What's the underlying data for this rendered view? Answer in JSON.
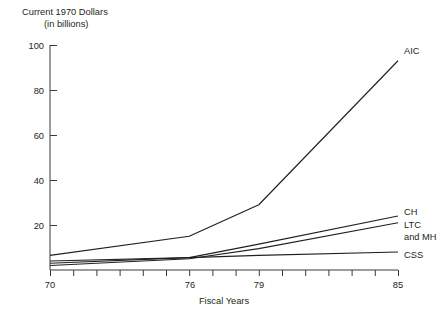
{
  "chart_data": {
    "type": "line",
    "title": "Current 1970 Dollars",
    "subtitle": "(in billions)",
    "xlabel": "Fiscal Years",
    "ylabel": "",
    "xlim": [
      70,
      85
    ],
    "ylim": [
      0,
      100
    ],
    "grid": false,
    "legend_position": "right-of-line-ends",
    "y_ticks": [
      20,
      40,
      60,
      80,
      100
    ],
    "y_tick_labels": [
      "20",
      "40",
      "60",
      "80",
      "100"
    ],
    "x_ticks": [
      70,
      71,
      72,
      73,
      74,
      75,
      76,
      77,
      78,
      79,
      80,
      81,
      82,
      83,
      84,
      85
    ],
    "x_tick_labels_shown": [
      "70",
      "76",
      "79",
      "85"
    ],
    "x_tick_label_values": [
      70,
      76,
      79,
      85
    ],
    "series": [
      {
        "name": "AIC",
        "label": "AIC",
        "x": [
          70,
          76,
          79,
          85
        ],
        "values": [
          6.5,
          15,
          29,
          93
        ]
      },
      {
        "name": "CH",
        "label": "CH",
        "x": [
          70,
          76,
          79,
          85
        ],
        "values": [
          3.0,
          5.5,
          11.5,
          24
        ]
      },
      {
        "name": "LTC and MH",
        "label": "LTC\nand MH",
        "label_line1": "LTC",
        "label_line2": "and MH",
        "x": [
          70,
          76,
          79,
          85
        ],
        "values": [
          2.0,
          5.0,
          9.5,
          21
        ]
      },
      {
        "name": "CSS",
        "label": "CSS",
        "x": [
          70,
          76,
          79,
          85
        ],
        "values": [
          4.0,
          5.5,
          6.5,
          8.0
        ]
      }
    ]
  },
  "chart": {
    "title_line1": "Current 1970 Dollars",
    "title_line2": "(in billions)",
    "x_axis_title": "Fiscal Years",
    "y_tick_100": "100",
    "y_tick_80": "80",
    "y_tick_60": "60",
    "y_tick_40": "40",
    "y_tick_20": "20",
    "x_tick_70": "70",
    "x_tick_76": "76",
    "x_tick_79": "79",
    "x_tick_85": "85",
    "series_label_aic": "AIC",
    "series_label_ch": "CH",
    "series_label_ltc_1": "LTC",
    "series_label_ltc_2": "and MH",
    "series_label_css": "CSS"
  }
}
